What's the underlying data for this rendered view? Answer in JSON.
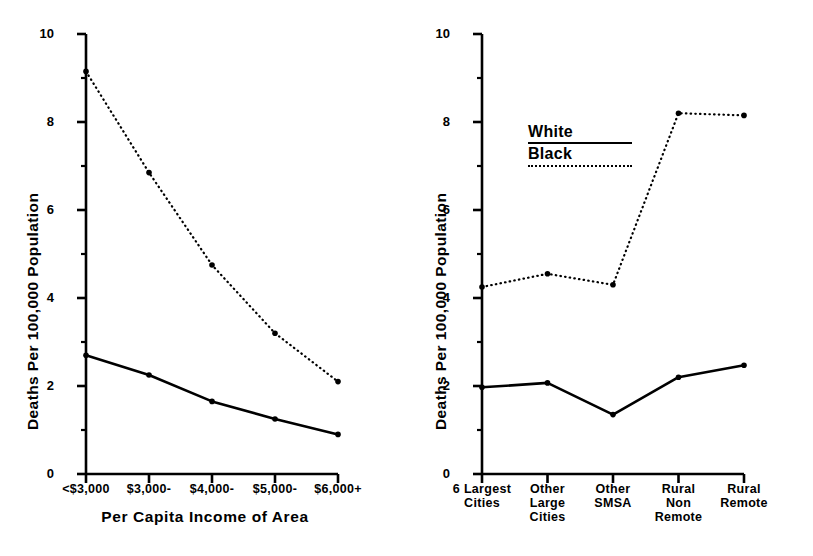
{
  "figure": {
    "background": "#ffffff",
    "ink_color": "#000000"
  },
  "legend": {
    "position": "inside-upper-left-of-right-panel",
    "entries": [
      {
        "label": "White",
        "style": "solid"
      },
      {
        "label": "Black",
        "style": "dotted"
      }
    ]
  },
  "chart_data": [
    {
      "id": "left",
      "type": "line",
      "title": "",
      "xlabel": "Per Capita Income of Area",
      "ylabel": "Deaths Per 100,000 Population",
      "categories": [
        "<$3,000",
        "$3,000-",
        "$4,000-",
        "$5,000-",
        "$6,000+"
      ],
      "ylim": [
        0,
        10
      ],
      "yticks": [
        0,
        2,
        4,
        6,
        8,
        10
      ],
      "yticklabels": [
        "0",
        "2",
        "4",
        "6",
        "8",
        "10"
      ],
      "yminorticks": [
        1,
        3,
        5,
        7,
        9
      ],
      "grid": false,
      "legend": "none",
      "series": [
        {
          "name": "White",
          "style": "solid",
          "values": [
            2.7,
            2.25,
            1.65,
            1.25,
            0.9
          ]
        },
        {
          "name": "Black",
          "style": "dotted",
          "values": [
            9.15,
            6.85,
            4.75,
            3.2,
            2.1
          ]
        }
      ]
    },
    {
      "id": "right",
      "type": "line",
      "title": "",
      "xlabel": "",
      "ylabel": "Deaths Per 100,000 Population",
      "categories": [
        "6 Largest Cities",
        "Other Large Cities",
        "Other SMSA",
        "Rural Non Remote",
        "Rural Remote"
      ],
      "categories_lines": [
        [
          "6 Largest",
          "Cities"
        ],
        [
          "Other",
          "Large",
          "Cities"
        ],
        [
          "Other",
          "SMSA"
        ],
        [
          "Rural",
          "Non",
          "Remote"
        ],
        [
          "Rural",
          "Remote"
        ]
      ],
      "ylim": [
        0,
        10
      ],
      "yticks": [
        0,
        2,
        4,
        6,
        8,
        10
      ],
      "yticklabels": [
        "0",
        "2",
        "4",
        "6",
        "8",
        "10"
      ],
      "yminorticks": [
        1,
        3,
        5,
        7,
        9
      ],
      "grid": false,
      "legend": "White / Black",
      "series": [
        {
          "name": "White",
          "style": "solid",
          "values": [
            1.97,
            2.07,
            1.35,
            2.2,
            2.47
          ]
        },
        {
          "name": "Black",
          "style": "dotted",
          "values": [
            4.25,
            4.55,
            4.3,
            8.2,
            8.15
          ]
        }
      ]
    }
  ]
}
